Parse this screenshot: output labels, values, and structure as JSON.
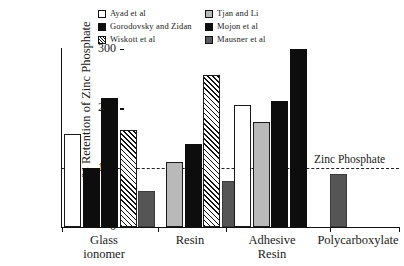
{
  "chart_data": {
    "type": "bar",
    "title": "",
    "xlabel": "",
    "ylabel": "% Retention of Zinc Phosphate",
    "ylim": [
      0,
      300
    ],
    "yticks": [
      0,
      100,
      200,
      300
    ],
    "ytick_labels": [
      "0",
      "100",
      "200",
      "300"
    ],
    "grid": false,
    "legend_position": "top-center",
    "categories": [
      "Glass ionomer",
      "Resin",
      "Adhesive Resin",
      "Polycarboxylate"
    ],
    "category_labels": [
      "Glass\nionomer",
      "Resin",
      "Adhesive\nResin",
      "Polycarboxylate"
    ],
    "series": [
      {
        "name": "Ayad et al",
        "style": "white",
        "values": [
          157,
          null,
          205,
          null
        ]
      },
      {
        "name": "Gorodovsky and Zidan",
        "style": "black",
        "values": [
          100,
          140,
          null,
          null
        ]
      },
      {
        "name": "Wiskott et al",
        "style": "hatch",
        "values": [
          163,
          257,
          null,
          null
        ]
      },
      {
        "name": "Tjan and Li",
        "style": "ltgray",
        "values": [
          null,
          110,
          177,
          null
        ]
      },
      {
        "name": "Mojon et al",
        "style": "black",
        "values": [
          217,
          null,
          212,
          null
        ]
      },
      {
        "name": "Mausner et al",
        "style": "dkgray",
        "values": [
          60,
          77,
          300,
          90
        ]
      }
    ],
    "reference_line": {
      "value": 100,
      "label": "Zinc Phosphate",
      "style": "dashed"
    },
    "bars": [
      {
        "group": "Glass ionomer",
        "series": "Ayad et al",
        "value": 157,
        "style": "white"
      },
      {
        "group": "Glass ionomer",
        "series": "Gorodovsky and Zidan",
        "value": 100,
        "style": "black"
      },
      {
        "group": "Glass ionomer",
        "series": "Mojon et al",
        "value": 217,
        "style": "black"
      },
      {
        "group": "Glass ionomer",
        "series": "Wiskott et al",
        "value": 163,
        "style": "hatch"
      },
      {
        "group": "Glass ionomer",
        "series": "Mausner et al",
        "value": 60,
        "style": "dkgray"
      },
      {
        "group": "Resin",
        "series": "Tjan and Li",
        "value": 110,
        "style": "ltgray"
      },
      {
        "group": "Resin",
        "series": "Gorodovsky and Zidan",
        "value": 140,
        "style": "black"
      },
      {
        "group": "Resin",
        "series": "Wiskott et al",
        "value": 257,
        "style": "hatch"
      },
      {
        "group": "Resin",
        "series": "Mausner et al",
        "value": 77,
        "style": "dkgray"
      },
      {
        "group": "Adhesive Resin",
        "series": "Ayad et al",
        "value": 205,
        "style": "white"
      },
      {
        "group": "Adhesive Resin",
        "series": "Tjan and Li",
        "value": 177,
        "style": "ltgray"
      },
      {
        "group": "Adhesive Resin",
        "series": "Mojon et al",
        "value": 212,
        "style": "black"
      },
      {
        "group": "Adhesive Resin",
        "series": "Mausner et al",
        "value": 300,
        "style": "black"
      },
      {
        "group": "Polycarboxylate",
        "series": "Mausner et al",
        "value": 90,
        "style": "dkgray"
      }
    ]
  },
  "legend": {
    "entries": [
      {
        "label": "Ayad et al",
        "style": "white"
      },
      {
        "label": "Tjan and Li",
        "style": "ltgray"
      },
      {
        "label": "Gorodovsky and Zidan",
        "style": "black"
      },
      {
        "label": "Mojon et al",
        "style": "black"
      },
      {
        "label": "Wiskott et al",
        "style": "hatch"
      },
      {
        "label": "Mausner et al",
        "style": "dkgray"
      }
    ]
  },
  "colors": {
    "white": "#ffffff",
    "black": "#0d0d0d",
    "light_gray": "#b9b9b9",
    "dark_gray": "#555555",
    "axis": "#111111",
    "background": "#ffffff"
  }
}
